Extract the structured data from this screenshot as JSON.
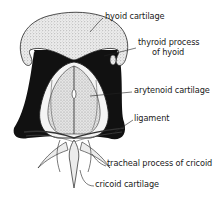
{
  "figure": {
    "labels": {
      "hyoid": "hyoid cartilage",
      "thyroid_process_line1": "thyroid process",
      "thyroid_process_line2": "of hyoid",
      "arytenoid": "arytenoid cartilage",
      "ligament": "ligament",
      "tracheal_process": "tracheal process of cricoid",
      "cricoid": "cricoid cartilage"
    },
    "colors": {
      "ink": "#111111",
      "stipple_bg": "#e8e8e8",
      "background": "#ffffff"
    }
  }
}
